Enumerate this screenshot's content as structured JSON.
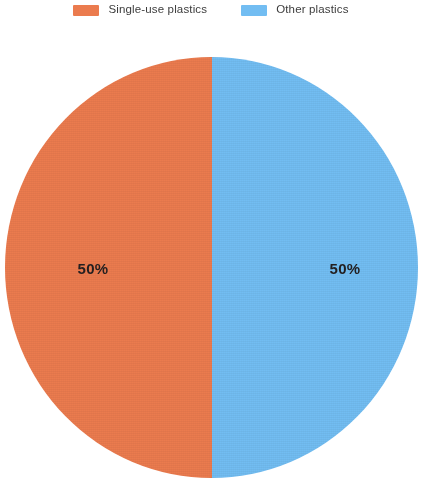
{
  "chart_data": {
    "type": "pie",
    "title": "",
    "subtitle": "",
    "xlabel": "",
    "ylabel": "",
    "legend_position": "top",
    "grid": false,
    "categories": [
      "Single-use plastics",
      "Other plastics"
    ],
    "values": [
      50,
      50
    ],
    "value_unit": "%",
    "data_labels": [
      "50%",
      "50%"
    ],
    "colors": [
      "#eb7b4e",
      "#72bdf2"
    ],
    "slices": [
      {
        "label": "Single-use plastics",
        "value": 50,
        "data_label": "50%",
        "color": "#eb7b4e",
        "start_angle": 180,
        "end_angle": 360
      },
      {
        "label": "Other plastics",
        "value": 50,
        "data_label": "50%",
        "color": "#72bdf2",
        "start_angle": 0,
        "end_angle": 180
      }
    ]
  },
  "legend": {
    "entries": [
      {
        "label": "Single-use plastics",
        "color": "#eb7b4e"
      },
      {
        "label": "Other plastics",
        "color": "#72bdf2"
      }
    ]
  },
  "colors": {
    "single_use": "#eb7b4e",
    "other": "#72bdf2",
    "label_text": "#231f20",
    "legend_text": "#3c3c3c",
    "background": "#ffffff"
  }
}
